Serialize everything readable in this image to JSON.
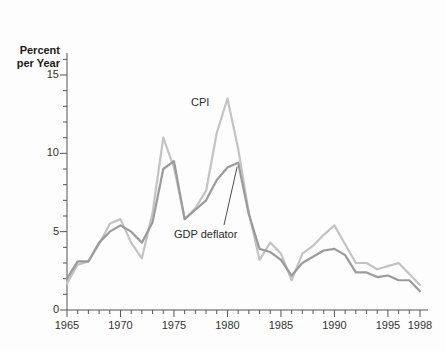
{
  "chart_data": {
    "type": "line",
    "title": "",
    "subtitle": "",
    "xlabel": "",
    "ylabel": "Percent per Year",
    "ylabel_lines": [
      "Percent",
      "per Year"
    ],
    "xlim": [
      1965,
      1998
    ],
    "ylim": [
      0,
      15
    ],
    "grid": false,
    "legend_position": "inline-annotation",
    "y_ticks_major": [
      0,
      5,
      10,
      15
    ],
    "y_tick_labels": [
      "0",
      "5",
      "10",
      "15"
    ],
    "y_minor_tick_step": 1,
    "x_ticks_major": [
      1965,
      1970,
      1975,
      1980,
      1985,
      1990,
      1995,
      1998
    ],
    "x_tick_labels": [
      "1965",
      "1970",
      "1975",
      "1980",
      "1985",
      "1990",
      "1995",
      "1998"
    ],
    "x_minor_tick_step": 1,
    "x": [
      1965,
      1966,
      1967,
      1968,
      1969,
      1970,
      1971,
      1972,
      1973,
      1974,
      1975,
      1976,
      1977,
      1978,
      1979,
      1980,
      1981,
      1982,
      1983,
      1984,
      1985,
      1986,
      1987,
      1988,
      1989,
      1990,
      1991,
      1992,
      1993,
      1994,
      1995,
      1996,
      1997,
      1998
    ],
    "series": [
      {
        "name": "CPI",
        "color": "#c3c3c3",
        "label_x": 1979,
        "values": [
          1.7,
          2.9,
          3.1,
          4.2,
          5.5,
          5.8,
          4.3,
          3.3,
          6.2,
          11.0,
          9.1,
          5.8,
          6.5,
          7.6,
          11.3,
          13.5,
          10.3,
          6.2,
          3.2,
          4.3,
          3.6,
          1.9,
          3.6,
          4.1,
          4.8,
          5.4,
          4.2,
          3.0,
          3.0,
          2.6,
          2.8,
          3.0,
          2.3,
          1.6
        ]
      },
      {
        "name": "GDP deflator",
        "color": "#9a9a9a",
        "label_x": 1977,
        "values": [
          2.0,
          3.1,
          3.1,
          4.3,
          5.0,
          5.4,
          5.0,
          4.3,
          5.6,
          9.0,
          9.5,
          5.8,
          6.4,
          7.0,
          8.3,
          9.1,
          9.4,
          6.1,
          3.9,
          3.7,
          3.2,
          2.2,
          3.0,
          3.4,
          3.8,
          3.9,
          3.5,
          2.4,
          2.4,
          2.1,
          2.2,
          1.9,
          1.9,
          1.2
        ]
      }
    ],
    "annotations": [
      {
        "text": "CPI",
        "target_year": 1979.5,
        "leader": false
      },
      {
        "text": "GDP deflator",
        "target_year": 1981,
        "leader": true
      }
    ]
  },
  "figure": {
    "background_color": "#fdfdfd",
    "axis_color": "#555555",
    "text_color": "#333333"
  }
}
